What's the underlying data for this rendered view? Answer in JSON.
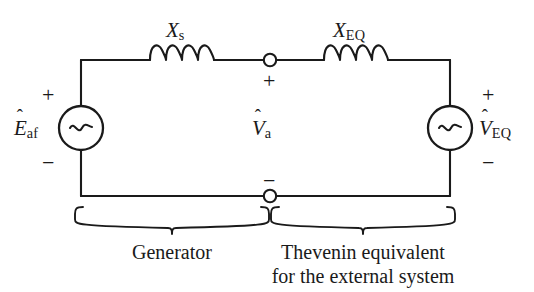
{
  "figure": {
    "background_color": "#ffffff",
    "line_color": "#1a1a1a"
  },
  "sources": {
    "left": {
      "name": "generator-voltage-source",
      "symbol": "~",
      "label_base": "E",
      "label_hat": "ˆ",
      "label_sub": "af",
      "plus_sign": "+",
      "minus_sign": "−"
    },
    "right": {
      "name": "thevenin-voltage-source",
      "symbol": "~",
      "label_base": "V",
      "label_hat": "ˆ",
      "label_sub": "EQ",
      "plus_sign": "+",
      "minus_sign": "−"
    }
  },
  "reactances": {
    "synchronous": {
      "label_base": "X",
      "label_sub": "s"
    },
    "equivalent": {
      "label_base": "X",
      "label_sub": "EQ"
    }
  },
  "terminal": {
    "label_base": "V",
    "label_hat": "ˆ",
    "label_sub": "a",
    "plus_sign": "+",
    "minus_sign": "−"
  },
  "braces": {
    "left_caption": "Generator",
    "right_caption_line1": "Thevenin equivalent",
    "right_caption_line2": "for the external system"
  }
}
